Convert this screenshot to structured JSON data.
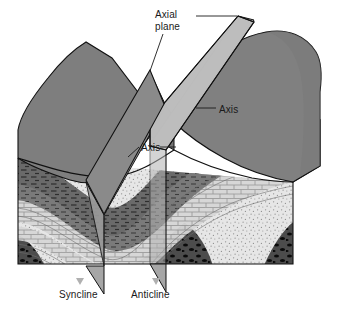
{
  "figure": {
    "kind": "geological-block-diagram",
    "labels": {
      "axial_plane": "Axial\nplane",
      "axis_upper": "Axis",
      "axis_inner": "Axis",
      "syncline": "Syncline",
      "anticline": "Anticline"
    },
    "colors": {
      "background": "#ffffff",
      "outline": "#111111",
      "block_top_left": "#7e7e7e",
      "block_top_right": "#808080",
      "block_side_right": "#6a6a6a",
      "axial_plane_light": "#b8b8b8",
      "axial_plane_dark": "#8d8d8d",
      "axial_plane_tab": "#a6a6a6",
      "shale_dark": "#6f6f6f",
      "shale_mid": "#8a8a8a",
      "limestone_light": "#d5d5d5",
      "limestone_line": "#8e8e8e",
      "sandstone_stipple": "#e2e2e2",
      "conglomerate": "#4a4a4a",
      "conglomerate_clast": "#0d0d0d",
      "leader_line": "#1a1a1a",
      "label_text": "#1a1a1a"
    },
    "strata": [
      {
        "name": "shale",
        "pattern": "dashes",
        "tone": "dark-gray"
      },
      {
        "name": "limestone",
        "pattern": "brick",
        "tone": "light-gray"
      },
      {
        "name": "sandstone",
        "pattern": "stipple",
        "tone": "very-light-gray"
      },
      {
        "name": "conglomerate",
        "pattern": "pebble-clasts",
        "tone": "dark-gray"
      }
    ],
    "features": [
      {
        "name": "syncline-axial-plane",
        "orientation": "inclined",
        "tone": "dark"
      },
      {
        "name": "anticline-axial-plane",
        "orientation": "inclined",
        "tone": "light"
      },
      {
        "name": "syncline-axis",
        "type": "trough-line"
      },
      {
        "name": "anticline-axis",
        "type": "crest-line"
      }
    ]
  }
}
